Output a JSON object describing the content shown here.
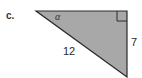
{
  "figure": {
    "part_label": "c.",
    "shape": "right-triangle",
    "angle_label": "α",
    "hypotenuse_label": "12",
    "vertical_leg_label": "7",
    "right_angle_marker": true,
    "colors": {
      "fill": "#a8a8a8",
      "stroke": "#2a2a2a",
      "background": "#ffffff"
    }
  }
}
